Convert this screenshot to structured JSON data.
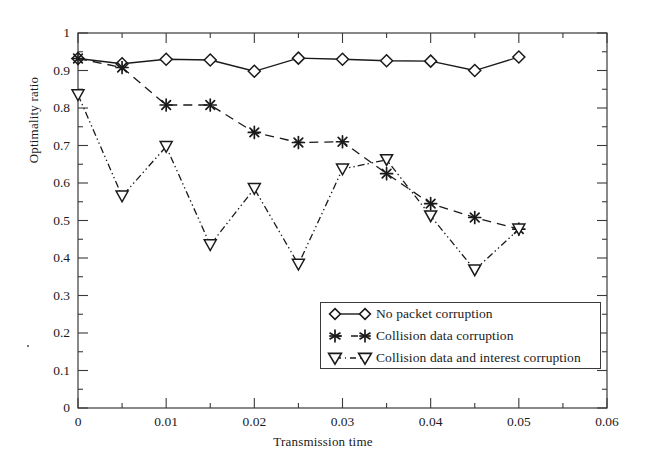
{
  "chart_data": {
    "type": "line",
    "title": "",
    "xlabel": "Transmission time",
    "ylabel": "Optimality ratio",
    "xlim": [
      0,
      0.06
    ],
    "ylim": [
      0,
      1
    ],
    "grid": false,
    "legend_position": "lower-center-right",
    "xticks": [
      "0",
      "0.01",
      "0.02",
      "0.03",
      "0.04",
      "0.05",
      "0.06"
    ],
    "xtick_values": [
      0,
      0.01,
      0.02,
      0.03,
      0.04,
      0.05,
      0.06
    ],
    "yticks": [
      "0",
      "0.1",
      "0.2",
      "0.3",
      "0.4",
      "0.5",
      "0.6",
      "0.7",
      "0.8",
      "0.9",
      "1"
    ],
    "ytick_values": [
      0,
      0.1,
      0.2,
      0.3,
      0.4,
      0.5,
      0.6,
      0.7,
      0.8,
      0.9,
      1
    ],
    "x": [
      0,
      0.005,
      0.01,
      0.015,
      0.02,
      0.025,
      0.03,
      0.035,
      0.04,
      0.045,
      0.05
    ],
    "series": [
      {
        "name": "No packet corruption",
        "marker": "diamond",
        "linestyle": "solid",
        "values": [
          0.932,
          0.918,
          0.93,
          0.928,
          0.898,
          0.933,
          0.93,
          0.926,
          0.925,
          0.9,
          0.936
        ]
      },
      {
        "name": "Collision data corruption",
        "marker": "asterisk",
        "linestyle": "dashed",
        "values": [
          0.932,
          0.908,
          0.808,
          0.808,
          0.735,
          0.708,
          0.71,
          0.625,
          0.545,
          0.508,
          0.477
        ]
      },
      {
        "name": "Collision data and interest corruption",
        "marker": "triangle-down",
        "linestyle": "dash-dot-dot",
        "values": [
          0.835,
          0.565,
          0.697,
          0.435,
          0.585,
          0.383,
          0.637,
          0.662,
          0.512,
          0.368,
          0.477
        ]
      }
    ]
  },
  "axes": {
    "ylabel": "Optimality ratio",
    "xlabel": "Transmission time"
  },
  "legend": {
    "entries": [
      {
        "label": "No packet corruption",
        "marker": "diamond-icon"
      },
      {
        "label": "Collision data corruption",
        "marker": "asterisk-icon"
      },
      {
        "label": "Collision data and interest corruption",
        "marker": "triangle-down-icon"
      }
    ]
  }
}
